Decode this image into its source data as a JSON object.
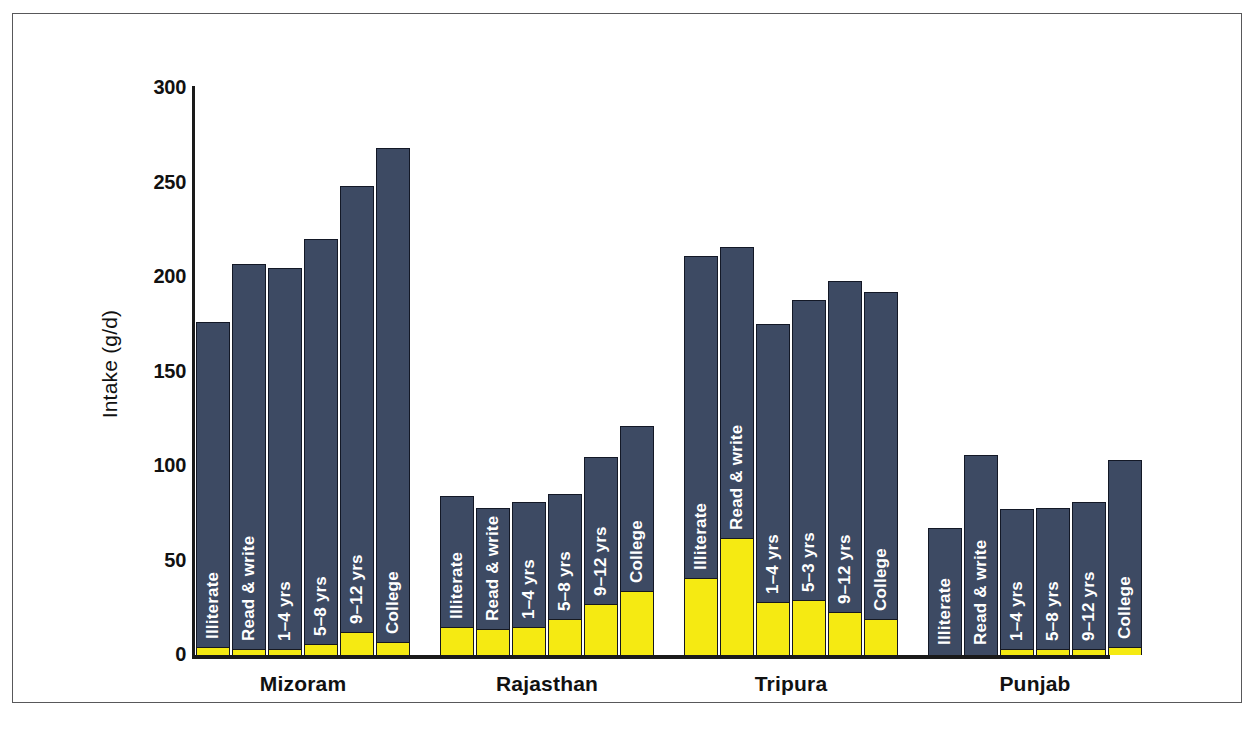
{
  "figure": {
    "y_axis_title": "Intake (g/d)",
    "y_ticks": [
      "0",
      "50",
      "100",
      "150",
      "200",
      "250",
      "300"
    ],
    "colors": {
      "dark_segment": "#3d4a63",
      "light_segment": "#f5ea12",
      "axis": "#1a1a1a",
      "frame": "#58585a",
      "bar_label_text": "#ffffff"
    }
  },
  "chart_data": {
    "type": "bar",
    "title": "",
    "subtitle": "",
    "xlabel": "",
    "ylabel": "Intake (g/d)",
    "ylim": [
      0,
      300
    ],
    "yticks": [
      0,
      50,
      100,
      150,
      200,
      250,
      300
    ],
    "grid": false,
    "legend": null,
    "stacked": true,
    "series": [
      {
        "name": "lower-segment",
        "color": "#f5ea12"
      },
      {
        "name": "upper-segment",
        "color": "#3d4a63"
      }
    ],
    "groups": [
      {
        "name": "Mizoram",
        "categories": [
          "Illiterate",
          "Read & write",
          "1–4 yrs",
          "5–8 yrs",
          "9–12 yrs",
          "College"
        ],
        "totals": [
          176,
          207,
          205,
          220,
          248,
          268
        ],
        "lower": [
          4,
          3,
          3,
          6,
          12,
          7
        ]
      },
      {
        "name": "Rajasthan",
        "categories": [
          "Illiterate",
          "Read & write",
          "1–4 yrs",
          "5–8 yrs",
          "9–12 yrs",
          "College"
        ],
        "totals": [
          84,
          78,
          81,
          85,
          105,
          121
        ],
        "lower": [
          15,
          14,
          15,
          19,
          27,
          34
        ]
      },
      {
        "name": "Tripura",
        "categories": [
          "Illiterate",
          "Read & write",
          "1–4 yrs",
          "5–3 yrs",
          "9–12 yrs",
          "College"
        ],
        "totals": [
          211,
          216,
          175,
          188,
          198,
          192
        ],
        "lower": [
          41,
          62,
          28,
          29,
          23,
          19
        ]
      },
      {
        "name": "Punjab",
        "categories": [
          "Illiterate",
          "Read & write",
          "1–4 yrs",
          "5–8 yrs",
          "9–12 yrs",
          "College"
        ],
        "totals": [
          67,
          106,
          77,
          78,
          81,
          103
        ],
        "lower": [
          0,
          0,
          3,
          3,
          3,
          4
        ]
      }
    ]
  }
}
